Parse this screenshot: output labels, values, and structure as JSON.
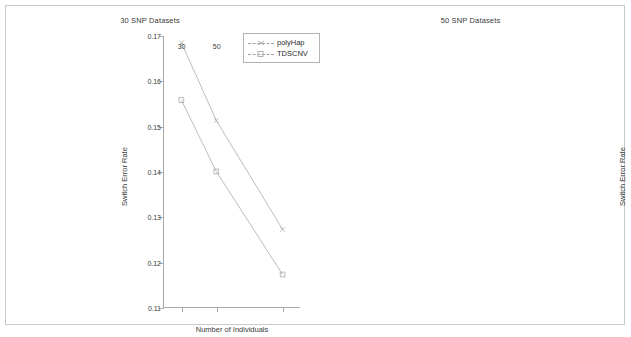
{
  "figure": {
    "background": "#ffffff",
    "frame_color": "#c9c9c9",
    "axis_color": "#a8a8a8",
    "series_color": "#a0a0a0"
  },
  "chart_data": [
    {
      "type": "line",
      "title": "30 SNP Datasets",
      "xlabel": "Number of Individuals",
      "ylabel": "Switch Error Rate",
      "categories": [
        "30",
        "50",
        "88"
      ],
      "x": [
        30,
        50,
        88
      ],
      "xtick_labels": [
        "30",
        "50",
        "88"
      ],
      "ytick_labels": [
        "0.11",
        "0.12",
        "0.13",
        "0.14",
        "0.15",
        "0.16",
        "0.17"
      ],
      "yticks": [
        0.11,
        0.12,
        0.13,
        0.14,
        0.15,
        0.16,
        0.17
      ],
      "ylim": [
        0.11,
        0.17
      ],
      "xlim": [
        20,
        98
      ],
      "grid": false,
      "legend_position": "upper right",
      "series": [
        {
          "name": "polyHap",
          "marker": "x",
          "values": [
            0.1685,
            0.1513,
            0.1272
          ]
        },
        {
          "name": "TDSCNV",
          "marker": "square",
          "values": [
            0.1558,
            0.14,
            0.1172
          ]
        }
      ]
    },
    {
      "type": "line",
      "title": "50 SNP Datasets",
      "xlabel": "Number of Individuals",
      "ylabel": "Switch Error Rate",
      "categories": [
        "30",
        "50",
        "88"
      ],
      "x": [
        30,
        50,
        88
      ],
      "xtick_labels": [
        "30",
        "50",
        "88"
      ],
      "ytick_labels": [
        "0.125",
        "0.13",
        "0.135",
        "0.14",
        "0.145",
        "0.15",
        "0.155",
        "0.16",
        "0.165",
        "0.17",
        "0.175"
      ],
      "yticks": [
        0.125,
        0.13,
        0.135,
        0.14,
        0.145,
        0.15,
        0.155,
        0.16,
        0.165,
        0.17,
        0.175
      ],
      "ylim": [
        0.125,
        0.175
      ],
      "xlim": [
        20,
        98
      ],
      "grid": false,
      "legend_position": "none",
      "series": [
        {
          "name": "polyHap",
          "marker": "x",
          "values": [
            0.1728,
            0.1608,
            0.1352
          ]
        },
        {
          "name": "TDSCNV",
          "marker": "square",
          "values": [
            0.1505,
            0.146,
            0.128
          ]
        }
      ]
    }
  ],
  "legend": {
    "entries": [
      {
        "label": "polyHap",
        "marker": "x"
      },
      {
        "label": "TDSCNV",
        "marker": "square"
      }
    ]
  }
}
